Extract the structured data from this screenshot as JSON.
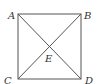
{
  "diagram": {
    "type": "geometry",
    "shape": "square with diagonals",
    "stroke_color": "#555555",
    "vertices": [
      {
        "label": "A",
        "position": "top-left"
      },
      {
        "label": "B",
        "position": "top-right"
      },
      {
        "label": "C",
        "position": "bottom-left"
      },
      {
        "label": "D",
        "position": "bottom-right"
      }
    ],
    "intersection": {
      "label": "E",
      "description": "intersection of diagonals AD and BC"
    },
    "segments": [
      "AB",
      "BD",
      "DC",
      "CA",
      "AD",
      "BC"
    ]
  }
}
